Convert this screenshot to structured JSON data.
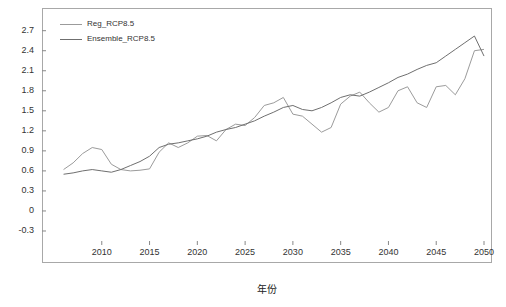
{
  "chart_data": {
    "type": "line",
    "title": "",
    "xlabel": "年份",
    "ylabel": "",
    "xlim": [
      2005,
      2050
    ],
    "ylim": [
      -0.45,
      2.95
    ],
    "grid": false,
    "legend_position": "top-left",
    "xticks": [
      2010,
      2015,
      2020,
      2025,
      2030,
      2035,
      2040,
      2045,
      2050
    ],
    "yticks": [
      "-0.3",
      "0",
      "0.3",
      "0.6",
      "0.9",
      "1.2",
      "1.5",
      "1.8",
      "2.1",
      "2.4",
      "2.7"
    ],
    "x": [
      2006,
      2007,
      2008,
      2009,
      2010,
      2011,
      2012,
      2013,
      2014,
      2015,
      2016,
      2017,
      2018,
      2019,
      2020,
      2021,
      2022,
      2023,
      2024,
      2025,
      2026,
      2027,
      2028,
      2029,
      2030,
      2031,
      2032,
      2033,
      2034,
      2035,
      2036,
      2037,
      2038,
      2039,
      2040,
      2041,
      2042,
      2043,
      2044,
      2045,
      2046,
      2047,
      2048,
      2049,
      2050
    ],
    "series": [
      {
        "name": "Reg_RCP8.5",
        "color": "#9b9b9b",
        "values": [
          0.62,
          0.72,
          0.86,
          0.95,
          0.92,
          0.7,
          0.62,
          0.6,
          0.61,
          0.63,
          0.88,
          1.02,
          0.95,
          1.02,
          1.12,
          1.13,
          1.05,
          1.22,
          1.3,
          1.28,
          1.4,
          1.58,
          1.62,
          1.7,
          1.45,
          1.42,
          1.3,
          1.18,
          1.25,
          1.6,
          1.72,
          1.78,
          1.62,
          1.48,
          1.55,
          1.8,
          1.86,
          1.62,
          1.55,
          1.86,
          1.88,
          1.74,
          1.98,
          2.4,
          2.42
        ]
      },
      {
        "name": "Ensemble_RCP8.5",
        "color": "#6f6f6f",
        "values": [
          0.55,
          0.57,
          0.6,
          0.62,
          0.6,
          0.58,
          0.62,
          0.68,
          0.74,
          0.82,
          0.95,
          1.0,
          1.02,
          1.05,
          1.08,
          1.12,
          1.18,
          1.22,
          1.25,
          1.3,
          1.35,
          1.42,
          1.48,
          1.55,
          1.58,
          1.52,
          1.5,
          1.55,
          1.62,
          1.7,
          1.74,
          1.72,
          1.78,
          1.85,
          1.92,
          2.0,
          2.05,
          2.12,
          2.18,
          2.22,
          2.32,
          2.42,
          2.52,
          2.62,
          2.32
        ]
      }
    ]
  }
}
